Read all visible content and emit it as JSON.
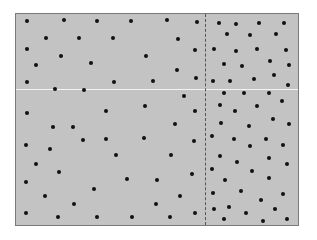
{
  "diagram": {
    "colors": {
      "background": "#ffffff",
      "panel_fill": "#c3c3c3",
      "panel_border": "#7a7a7a",
      "dot": "#111111",
      "horizontal_line": "#f2f2f2",
      "divider": "#555555"
    },
    "panel": {
      "x": 15,
      "y": 13,
      "width": 284,
      "height": 213
    },
    "horizontal_line_y": 88,
    "vertical_divider_x": 204,
    "regions": [
      {
        "name": "left-sparse",
        "x_range": [
          15,
          204
        ]
      },
      {
        "name": "right-dense",
        "x_range": [
          204,
          299
        ]
      }
    ],
    "dots": [
      [
        27,
        21
      ],
      [
        64,
        20
      ],
      [
        97,
        21
      ],
      [
        131,
        21
      ],
      [
        167,
        20
      ],
      [
        197,
        22
      ],
      [
        46,
        38
      ],
      [
        79,
        38
      ],
      [
        113,
        38
      ],
      [
        178,
        39
      ],
      [
        27,
        49
      ],
      [
        61,
        56
      ],
      [
        146,
        56
      ],
      [
        195,
        50
      ],
      [
        36,
        65
      ],
      [
        91,
        63
      ],
      [
        177,
        70
      ],
      [
        27,
        82
      ],
      [
        55,
        89
      ],
      [
        84,
        90
      ],
      [
        114,
        82
      ],
      [
        153,
        81
      ],
      [
        196,
        78
      ],
      [
        219,
        23
      ],
      [
        236,
        24
      ],
      [
        259,
        23
      ],
      [
        284,
        23
      ],
      [
        227,
        34
      ],
      [
        250,
        35
      ],
      [
        276,
        34
      ],
      [
        214,
        49
      ],
      [
        236,
        51
      ],
      [
        257,
        49
      ],
      [
        286,
        50
      ],
      [
        224,
        64
      ],
      [
        242,
        66
      ],
      [
        270,
        61
      ],
      [
        289,
        65
      ],
      [
        213,
        81
      ],
      [
        230,
        81
      ],
      [
        254,
        79
      ],
      [
        274,
        75
      ],
      [
        288,
        85
      ],
      [
        27,
        113
      ],
      [
        53,
        127
      ],
      [
        73,
        127
      ],
      [
        106,
        111
      ],
      [
        106,
        139
      ],
      [
        26,
        145
      ],
      [
        50,
        149
      ],
      [
        83,
        140
      ],
      [
        145,
        106
      ],
      [
        184,
        96
      ],
      [
        195,
        111
      ],
      [
        175,
        124
      ],
      [
        144,
        138
      ],
      [
        194,
        141
      ],
      [
        116,
        155
      ],
      [
        171,
        155
      ],
      [
        224,
        93
      ],
      [
        244,
        93
      ],
      [
        269,
        93
      ],
      [
        282,
        101
      ],
      [
        220,
        105
      ],
      [
        235,
        111
      ],
      [
        257,
        106
      ],
      [
        273,
        119
      ],
      [
        221,
        123
      ],
      [
        249,
        126
      ],
      [
        289,
        124
      ],
      [
        212,
        136
      ],
      [
        234,
        139
      ],
      [
        266,
        139
      ],
      [
        250,
        146
      ],
      [
        283,
        145
      ],
      [
        36,
        164
      ],
      [
        59,
        172
      ],
      [
        26,
        182
      ],
      [
        45,
        196
      ],
      [
        74,
        204
      ],
      [
        94,
        189
      ],
      [
        26,
        213
      ],
      [
        58,
        217
      ],
      [
        97,
        217
      ],
      [
        127,
        179
      ],
      [
        157,
        180
      ],
      [
        192,
        174
      ],
      [
        180,
        196
      ],
      [
        156,
        204
      ],
      [
        132,
        217
      ],
      [
        170,
        217
      ],
      [
        195,
        213
      ],
      [
        220,
        156
      ],
      [
        237,
        162
      ],
      [
        269,
        158
      ],
      [
        287,
        164
      ],
      [
        212,
        169
      ],
      [
        252,
        171
      ],
      [
        225,
        180
      ],
      [
        269,
        178
      ],
      [
        213,
        193
      ],
      [
        241,
        191
      ],
      [
        261,
        200
      ],
      [
        283,
        194
      ],
      [
        214,
        209
      ],
      [
        229,
        207
      ],
      [
        246,
        213
      ],
      [
        275,
        209
      ],
      [
        224,
        219
      ],
      [
        263,
        221
      ],
      [
        287,
        219
      ]
    ]
  }
}
